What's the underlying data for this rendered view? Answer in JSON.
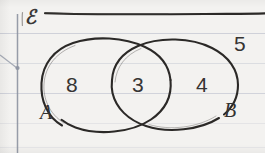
{
  "diagram": {
    "kind": "venn-diagram",
    "title_symbol": "ℰ",
    "universal_set_label": "ℰ",
    "sets": [
      {
        "id": "A",
        "label": "A",
        "only_count": "8"
      },
      {
        "id": "B",
        "label": "B",
        "only_count": "4"
      }
    ],
    "regions": [
      {
        "name": "a-only",
        "value": "8"
      },
      {
        "name": "intersection",
        "value": "3"
      },
      {
        "name": "b-only",
        "value": "4"
      },
      {
        "name": "outside",
        "value": "5"
      }
    ],
    "values": {
      "a_only": "8",
      "intersection": "3",
      "b_only": "4",
      "outside": "5"
    }
  },
  "colors": {
    "paper": "#f3f2f0",
    "ink": "#2e2c2b",
    "rule_line": "#c9ccd6",
    "margin_line": "#9aa0ad"
  }
}
